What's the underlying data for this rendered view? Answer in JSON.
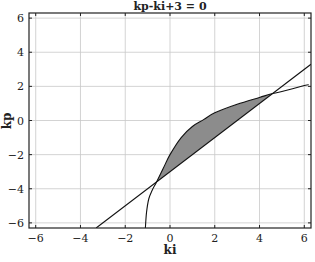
{
  "chart_data": {
    "type": "line",
    "title": "kp-ki+3 = 0",
    "xlabel": "ki",
    "ylabel": "kp",
    "xlim": [
      -6.3,
      6.3
    ],
    "ylim": [
      -6.3,
      6.3
    ],
    "xticks": [
      -6,
      -4,
      -2,
      0,
      2,
      4,
      6
    ],
    "yticks": [
      -6,
      -4,
      -2,
      0,
      2,
      4,
      6
    ],
    "xtick_labels": [
      "-6",
      "-4",
      "-2",
      "0",
      "2",
      "4",
      "6"
    ],
    "ytick_labels": [
      "-6",
      "-4",
      "-2",
      "0",
      "2",
      "4",
      "6"
    ],
    "grid": true,
    "legend": null,
    "series": [
      {
        "name": "line kp = ki - 3",
        "kind": "line",
        "x": [
          -3.3,
          6.3
        ],
        "y": [
          -6.3,
          3.3
        ]
      },
      {
        "name": "stability boundary curve",
        "kind": "curve",
        "x": [
          -1.1,
          -1.05,
          -0.95,
          -0.8,
          -0.6,
          -0.3,
          0.0,
          0.5,
          1.0,
          1.5,
          2.0,
          3.0,
          4.0,
          4.5,
          5.0,
          6.0,
          6.2
        ],
        "y": [
          -6.3,
          -5.4,
          -4.6,
          -4.1,
          -3.6,
          -2.8,
          -2.0,
          -1.0,
          -0.35,
          0.05,
          0.45,
          0.95,
          1.35,
          1.55,
          1.7,
          2.05,
          2.1
        ]
      }
    ],
    "shaded_region": {
      "description": "region between curve (upper) and line (lower)",
      "fill": "#8c8c8c",
      "x_range": [
        -0.6,
        4.5
      ]
    },
    "intersections": [
      {
        "ki": -0.6,
        "kp": -3.6
      },
      {
        "ki": 4.5,
        "kp": 1.5
      }
    ]
  },
  "colors": {
    "background": "#ffffff",
    "grid": "#c8c8c8",
    "axis": "#222222",
    "line": "#111111",
    "fill": "#8c8c8c"
  }
}
